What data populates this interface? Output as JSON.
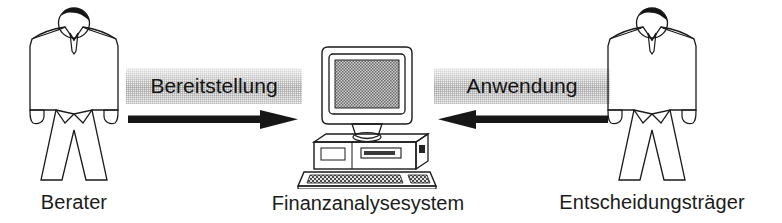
{
  "diagram": {
    "type": "actor-system-flow",
    "background_color": "#ffffff",
    "ink_color": "#1a1a1a",
    "label_plate_color": "#e9e9e9",
    "nodes": [
      {
        "id": "advisor",
        "icon": "person-figure-icon",
        "label": "Berater"
      },
      {
        "id": "system",
        "icon": "desktop-computer-icon",
        "label": "Finanzanalysesystem"
      },
      {
        "id": "decision-maker",
        "icon": "person-figure-icon",
        "label": "Entscheidungsträger"
      }
    ],
    "flows": [
      {
        "id": "provision",
        "label": "Bereitstellung",
        "from": "advisor",
        "to": "system",
        "direction": "right",
        "arrow_icon": "arrow-right-icon"
      },
      {
        "id": "usage",
        "label": "Anwendung",
        "from": "decision-maker",
        "to": "system",
        "direction": "left",
        "arrow_icon": "arrow-left-icon"
      }
    ]
  }
}
